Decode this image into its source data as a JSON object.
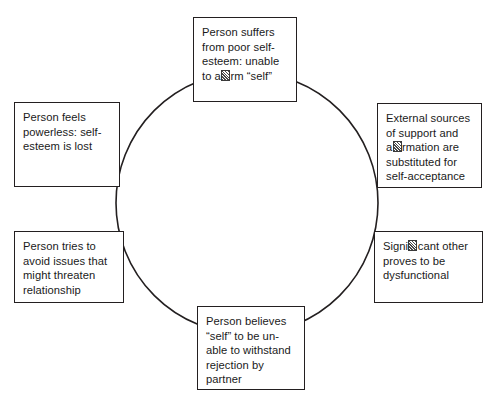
{
  "diagram": {
    "type": "cyclical-flow",
    "shape": "circle",
    "node_count": 6,
    "flow_direction": "clockwise",
    "colors": {
      "background": "#ffffff",
      "box_border": "#231f20",
      "circle_stroke": "#231f20",
      "text": "#1a1a1a"
    },
    "circle": {
      "center_x": 247,
      "center_y": 203,
      "radius": 131,
      "stroke_width": 1.6
    },
    "nodes": [
      {
        "id": "poor-self-esteem",
        "position": "top",
        "text_line_1": "Person suffers",
        "text_line_2": "from poor self-",
        "text_line_3": "esteem: unable",
        "text_line_4_before_glyph": "to a",
        "text_line_4_after_glyph": "rm “self”",
        "glyph_note": "ffi-ligature missing glyph",
        "plain_text": "Person suffers from poor self-esteem: unable to affirm “self”"
      },
      {
        "id": "external-sources",
        "position": "right-upper",
        "text_line_1": "External sources",
        "text_line_2": "of support and",
        "text_line_3_before_glyph": "a",
        "text_line_3_after_glyph": "rmation are",
        "text_line_4": "substituted for",
        "text_line_5": "self-acceptance",
        "glyph_note": "ffi-ligature missing glyph",
        "plain_text": "External sources of support and affirmation are substituted for self-acceptance"
      },
      {
        "id": "significant-other-dysfunctional",
        "position": "right-lower",
        "text_line_1_before_glyph": "Signi",
        "text_line_1_after_glyph": "cant other",
        "text_line_2": "proves to be",
        "text_line_3": "dysfunctional",
        "glyph_note": "fi-ligature missing glyph",
        "plain_text": "Significant other proves to be dysfunctional"
      },
      {
        "id": "self-unable-withstand-rejection",
        "position": "bottom",
        "text_line_1": "Person believes",
        "text_line_2": "“self” to be un-",
        "text_line_3": "able to withstand",
        "text_line_4": "rejection by",
        "text_line_5": "partner",
        "plain_text": "Person believes “self” to be unable to withstand rejection by partner"
      },
      {
        "id": "avoid-threatening-issues",
        "position": "left-lower",
        "text_line_1": "Person tries to",
        "text_line_2": "avoid issues that",
        "text_line_3": "might threaten",
        "text_line_4": "relationship",
        "plain_text": "Person tries to avoid issues that might threaten relationship"
      },
      {
        "id": "feels-powerless",
        "position": "left-upper",
        "text_line_1": "Person feels",
        "text_line_2": "powerless: self-",
        "text_line_3": "esteem is lost",
        "plain_text": "Person feels powerless: self-esteem is lost"
      }
    ]
  },
  "caption": {
    "text": "",
    "note": "caption line at page bottom is cropped and illegible"
  }
}
